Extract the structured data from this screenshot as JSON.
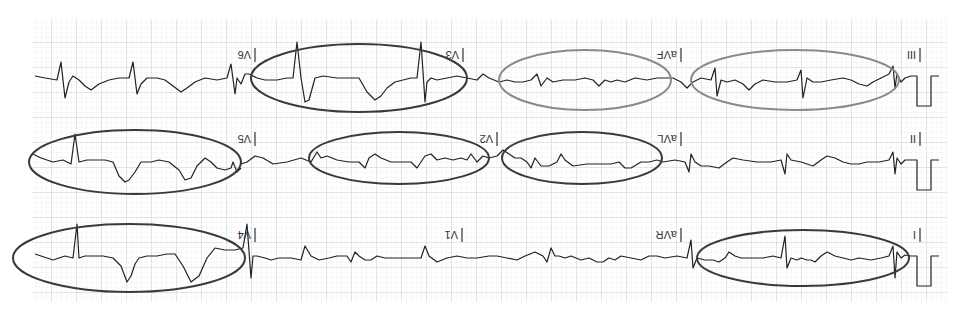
{
  "figure": {
    "orientation": "rotated-180",
    "grid": {
      "minor_color": "#e3e3e3",
      "major_color": "#c8c8c8",
      "background": "#ffffff",
      "left": 32,
      "top": 19,
      "right": 947,
      "bottom": 302
    },
    "colors": {
      "trace": "#222222",
      "ellipse_dark": "#3a3a3a",
      "ellipse_gray": "#8a8a8a"
    },
    "rows": [
      {
        "leads": [
          "I",
          "aVR",
          "V1",
          "V4"
        ],
        "highlights": [
          {
            "lead": "I",
            "style": "dark"
          },
          {
            "lead": "V4",
            "style": "dark"
          }
        ]
      },
      {
        "leads": [
          "II",
          "aVL",
          "V2",
          "V5"
        ],
        "highlights": [
          {
            "lead": "aVL",
            "style": "dark"
          },
          {
            "lead": "V2",
            "style": "dark"
          },
          {
            "lead": "V5",
            "style": "dark"
          }
        ]
      },
      {
        "leads": [
          "III",
          "aVF",
          "V3",
          "V6"
        ],
        "highlights": [
          {
            "lead": "III",
            "style": "gray"
          },
          {
            "lead": "aVF",
            "style": "gray"
          },
          {
            "lead": "V3",
            "style": "dark"
          }
        ]
      }
    ],
    "labels": {
      "I": "I",
      "II": "II",
      "III": "III",
      "aVR": "aVR",
      "aVL": "aVL",
      "aVF": "aVF",
      "V1": "V1",
      "V2": "V2",
      "V3": "V3",
      "V4": "V4",
      "V5": "V5",
      "V6": "V6"
    }
  }
}
